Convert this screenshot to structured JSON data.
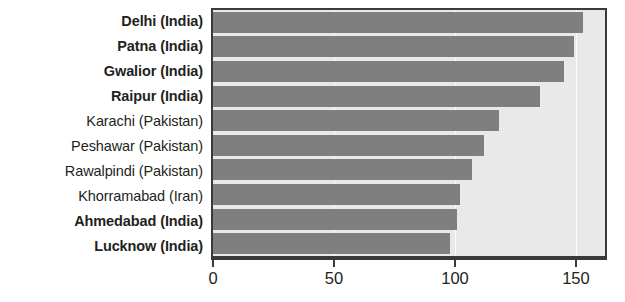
{
  "chart_data": {
    "type": "bar",
    "orientation": "horizontal",
    "title": "",
    "xlabel": "",
    "ylabel": "",
    "xlim": [
      0,
      162
    ],
    "xticks": [
      0,
      50,
      100,
      150
    ],
    "xtick_labels": [
      "0",
      "50",
      "100",
      "150"
    ],
    "grid": false,
    "legend": "none",
    "categories": [
      "Delhi (India)",
      "Patna (India)",
      "Gwalior (India)",
      "Raipur (India)",
      "Karachi (Pakistan)",
      "Peshawar (Pakistan)",
      "Rawalpindi (Pakistan)",
      "Khorramabad (Iran)",
      "Ahmedabad (India)",
      "Lucknow (India)"
    ],
    "values": [
      153,
      149,
      145,
      135,
      118,
      112,
      107,
      102,
      101,
      98
    ],
    "bars": [
      {
        "label": "Delhi (India)",
        "value": 153,
        "emphasis": true
      },
      {
        "label": "Patna (India)",
        "value": 149,
        "emphasis": true
      },
      {
        "label": "Gwalior (India)",
        "value": 145,
        "emphasis": true
      },
      {
        "label": "Raipur (India)",
        "value": 135,
        "emphasis": true
      },
      {
        "label": "Karachi (Pakistan)",
        "value": 118,
        "emphasis": false
      },
      {
        "label": "Peshawar (Pakistan)",
        "value": 112,
        "emphasis": false
      },
      {
        "label": "Rawalpindi (Pakistan)",
        "value": 107,
        "emphasis": false
      },
      {
        "label": "Khorramabad (Iran)",
        "value": 102,
        "emphasis": false
      },
      {
        "label": "Ahmedabad (India)",
        "value": 101,
        "emphasis": true
      },
      {
        "label": "Lucknow (India)",
        "value": 98,
        "emphasis": true
      }
    ],
    "colors": {
      "bar": "#7f7f7f",
      "plot_background": "#e9e9e9",
      "plot_border": "#3a3a3a",
      "gridline": "#fbfbfb",
      "text": "#231f20",
      "page_background": "#ffffff"
    }
  }
}
